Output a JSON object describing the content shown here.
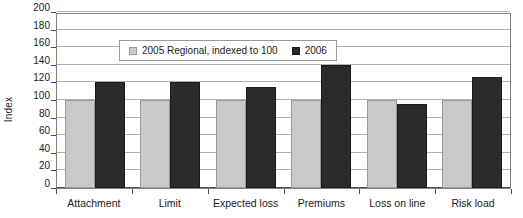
{
  "chart_data": {
    "type": "bar",
    "title": "",
    "xlabel": "",
    "ylabel": "Index",
    "ylim": [
      0,
      200
    ],
    "yticks": [
      0,
      20,
      40,
      60,
      80,
      100,
      120,
      140,
      160,
      180,
      200
    ],
    "grid": true,
    "legend_position": "upper-left-inside",
    "categories": [
      "Attachment",
      "Limit",
      "Expected loss",
      "Premiums",
      "Loss on line",
      "Risk load"
    ],
    "series": [
      {
        "name": "2005 Regional, indexed to 100",
        "color": "#c9c9c9",
        "values": [
          100,
          100,
          100,
          100,
          100,
          100
        ]
      },
      {
        "name": "2006",
        "color": "#2b2b2b",
        "values": [
          120,
          121,
          115,
          140,
          95,
          126
        ]
      }
    ]
  },
  "legend": {
    "entries": [
      {
        "label": "2005 Regional, indexed to 100"
      },
      {
        "label": "2006"
      }
    ]
  },
  "axis": {
    "y_title": "Index"
  }
}
